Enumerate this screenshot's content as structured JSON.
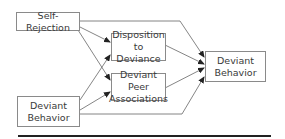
{
  "diagram": {
    "nodes": [
      {
        "id": "self_rejection",
        "lines": [
          "Self-Rejection"
        ]
      },
      {
        "id": "disposition",
        "lines": [
          "Disposition",
          "to Deviance"
        ]
      },
      {
        "id": "peer",
        "lines": [
          "Deviant Peer",
          "Associations"
        ]
      },
      {
        "id": "behavior_in",
        "lines": [
          "Deviant",
          "Behavior"
        ]
      },
      {
        "id": "behavior_out",
        "lines": [
          "Deviant",
          "Behavior"
        ]
      }
    ],
    "edges": [
      {
        "from": "self_rejection",
        "to": "disposition"
      },
      {
        "from": "self_rejection",
        "to": "peer"
      },
      {
        "from": "self_rejection",
        "to": "behavior_out"
      },
      {
        "from": "behavior_in",
        "to": "disposition"
      },
      {
        "from": "behavior_in",
        "to": "peer"
      },
      {
        "from": "behavior_in",
        "to": "behavior_out"
      },
      {
        "from": "disposition",
        "to": "behavior_out"
      },
      {
        "from": "peer",
        "to": "behavior_out"
      }
    ]
  }
}
